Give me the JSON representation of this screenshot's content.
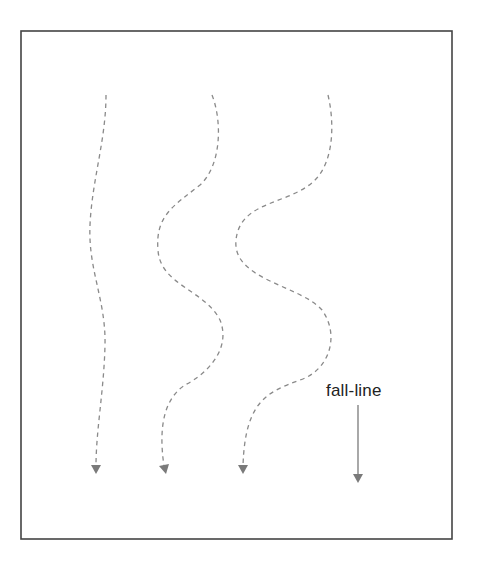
{
  "diagram": {
    "title": "",
    "frame": {
      "x": 21,
      "y": 31,
      "width": 431,
      "height": 508,
      "stroke": "#444444"
    },
    "label": {
      "text": "fall-line"
    },
    "fall_line_arrow": {
      "x": 358,
      "y1": 405,
      "y2": 482,
      "color": "#7a7a7a"
    },
    "tracks": [
      {
        "name": "track-1",
        "style": "dashed",
        "path": "M106,95 C106,140 92,180 90,225 C88,270 106,300 105,345 C104,390 96,430 96,466",
        "end": {
          "x": 96,
          "y": 473
        }
      },
      {
        "name": "track-2",
        "style": "dashed",
        "path": "M212,95 C222,120 222,165 200,185 C175,205 155,215 158,250 C160,285 205,290 220,320 C232,350 205,375 185,385 C165,398 158,425 164,466",
        "end": {
          "x": 165,
          "y": 473
        }
      },
      {
        "name": "track-3",
        "style": "dashed",
        "path": "M328,95 C334,120 335,160 315,180 C290,205 240,200 236,240 C232,280 300,285 322,310 C340,335 330,370 300,380 C268,392 245,400 243,466",
        "end": {
          "x": 243,
          "y": 473
        }
      }
    ],
    "colors": {
      "background": "#ffffff",
      "track": "#8a8a8a",
      "text": "#222222"
    }
  }
}
